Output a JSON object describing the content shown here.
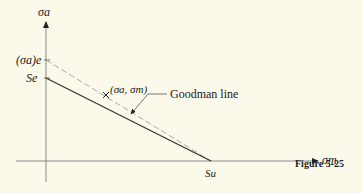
{
  "figure": {
    "caption": "Figure 5-25",
    "y_axis_label": "σa",
    "x_axis_label": "σm",
    "y_tick_upper": "(σa)e",
    "y_tick_lower": "Se",
    "x_tick": "Su",
    "point_label": "(σa, σm)",
    "callout_label": "Goodman line",
    "colors": {
      "background": "#fbf9ea",
      "line": "#333333",
      "dashed": "#aaaaaa",
      "axis": "#888888"
    }
  }
}
